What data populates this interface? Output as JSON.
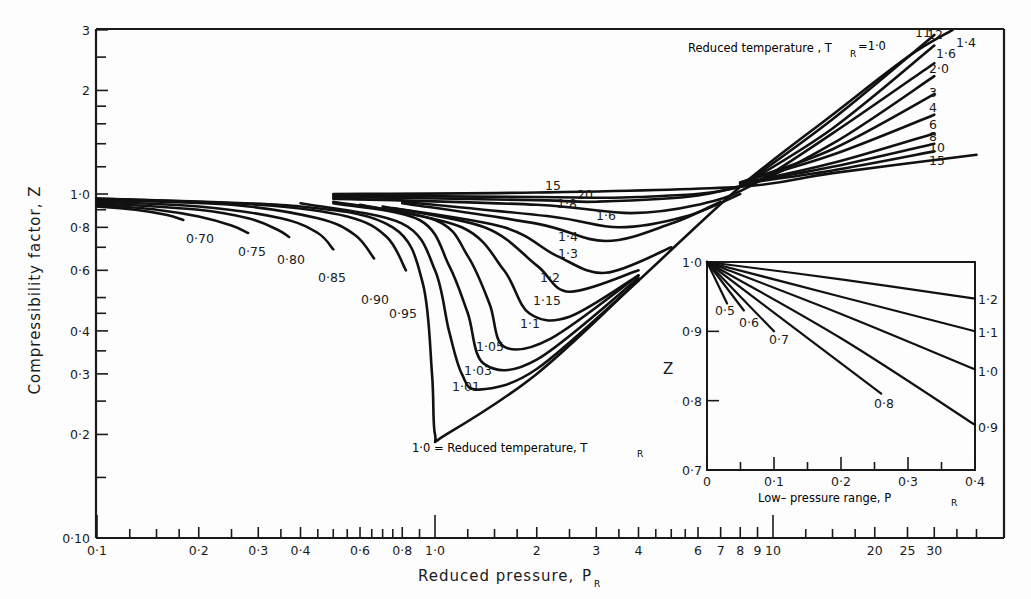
{
  "chart_data": {
    "type": "line",
    "xlabel": "Reduced pressure, P_R",
    "ylabel": "Compressibility factor, Z",
    "x_scale": "log",
    "y_scale": "log",
    "xlim": [
      0.1,
      45
    ],
    "ylim": [
      0.1,
      3
    ],
    "grid": false,
    "x_ticks_labeled": [
      "0·1",
      "0·2",
      "0·3",
      "0·4",
      "0·6",
      "0·8",
      "1·0",
      "2",
      "3",
      "4",
      "6",
      "7",
      "8",
      "9",
      "10",
      "20",
      "25",
      "30"
    ],
    "x_tick_values": [
      0.1,
      0.2,
      0.3,
      0.4,
      0.6,
      0.8,
      1.0,
      2,
      3,
      4,
      6,
      7,
      8,
      9,
      10,
      20,
      25,
      30
    ],
    "y_ticks_labeled": [
      "3",
      "2",
      "1·0",
      "0·8",
      "0·6",
      "0·4",
      "0·3",
      "0·2",
      "0·10"
    ],
    "y_tick_values": [
      3,
      2,
      1.0,
      0.8,
      0.6,
      0.4,
      0.3,
      0.2,
      0.1
    ],
    "annotations": [
      "Reduced temperature, T_R = 1·0",
      "1·0 = Reduced temperature, T_R"
    ],
    "series": [
      {
        "name": "T_R=0.70",
        "points": [
          [
            0.1,
            0.92
          ],
          [
            0.13,
            0.9
          ],
          [
            0.16,
            0.87
          ],
          [
            0.18,
            0.84
          ]
        ]
      },
      {
        "name": "T_R=0.75",
        "points": [
          [
            0.1,
            0.93
          ],
          [
            0.15,
            0.9
          ],
          [
            0.2,
            0.86
          ],
          [
            0.25,
            0.81
          ],
          [
            0.28,
            0.77
          ]
        ]
      },
      {
        "name": "T_R=0.80",
        "points": [
          [
            0.1,
            0.94
          ],
          [
            0.2,
            0.9
          ],
          [
            0.28,
            0.85
          ],
          [
            0.34,
            0.79
          ],
          [
            0.37,
            0.75
          ]
        ]
      },
      {
        "name": "T_R=0.85",
        "points": [
          [
            0.1,
            0.95
          ],
          [
            0.2,
            0.92
          ],
          [
            0.35,
            0.85
          ],
          [
            0.45,
            0.77
          ],
          [
            0.5,
            0.69
          ]
        ]
      },
      {
        "name": "T_R=0.90",
        "points": [
          [
            0.1,
            0.96
          ],
          [
            0.25,
            0.93
          ],
          [
            0.45,
            0.85
          ],
          [
            0.58,
            0.76
          ],
          [
            0.66,
            0.65
          ]
        ]
      },
      {
        "name": "T_R=0.95",
        "points": [
          [
            0.1,
            0.97
          ],
          [
            0.3,
            0.93
          ],
          [
            0.55,
            0.86
          ],
          [
            0.72,
            0.75
          ],
          [
            0.82,
            0.6
          ]
        ]
      },
      {
        "name": "T_R=1.0",
        "points": [
          [
            0.1,
            0.97
          ],
          [
            0.4,
            0.92
          ],
          [
            0.75,
            0.8
          ],
          [
            0.92,
            0.55
          ],
          [
            0.98,
            0.3
          ],
          [
            1.0,
            0.2
          ],
          [
            1.08,
            0.2
          ],
          [
            2,
            0.3
          ],
          [
            4,
            0.56
          ],
          [
            8,
            1.05
          ],
          [
            15,
            1.7
          ],
          [
            25,
            2.5
          ],
          [
            34,
            3.0
          ]
        ]
      },
      {
        "name": "T_R=1.01",
        "points": [
          [
            0.4,
            0.94
          ],
          [
            0.8,
            0.82
          ],
          [
            1.0,
            0.6
          ],
          [
            1.1,
            0.4
          ],
          [
            1.2,
            0.3
          ],
          [
            1.35,
            0.27
          ],
          [
            2,
            0.31
          ],
          [
            4,
            0.56
          ]
        ]
      },
      {
        "name": "T_R=1.03",
        "points": [
          [
            0.5,
            0.94
          ],
          [
            0.9,
            0.84
          ],
          [
            1.1,
            0.62
          ],
          [
            1.25,
            0.45
          ],
          [
            1.4,
            0.32
          ],
          [
            2,
            0.33
          ],
          [
            4,
            0.57
          ]
        ]
      },
      {
        "name": "T_R=1.05",
        "points": [
          [
            0.5,
            0.95
          ],
          [
            1.0,
            0.84
          ],
          [
            1.25,
            0.66
          ],
          [
            1.45,
            0.48
          ],
          [
            1.6,
            0.36
          ],
          [
            2.2,
            0.38
          ],
          [
            4,
            0.58
          ]
        ]
      },
      {
        "name": "T_R=1.1",
        "points": [
          [
            0.6,
            0.93
          ],
          [
            1.2,
            0.8
          ],
          [
            1.6,
            0.6
          ],
          [
            1.9,
            0.45
          ],
          [
            2.5,
            0.44
          ],
          [
            4,
            0.58
          ]
        ]
      },
      {
        "name": "T_R=1.15",
        "points": [
          [
            0.7,
            0.92
          ],
          [
            1.4,
            0.8
          ],
          [
            2,
            0.62
          ],
          [
            2.5,
            0.52
          ],
          [
            4,
            0.6
          ]
        ]
      },
      {
        "name": "T_R=1.2",
        "points": [
          [
            0.75,
            0.91
          ],
          [
            1.6,
            0.8
          ],
          [
            2.3,
            0.66
          ],
          [
            3.2,
            0.59
          ],
          [
            5,
            0.7
          ]
        ]
      },
      {
        "name": "T_R=1.3",
        "points": [
          [
            0.8,
            0.94
          ],
          [
            2,
            0.82
          ],
          [
            3.2,
            0.73
          ],
          [
            5,
            0.82
          ],
          [
            7,
            0.95
          ]
        ]
      },
      {
        "name": "T_R=1.4",
        "points": [
          [
            0.8,
            0.95
          ],
          [
            2.2,
            0.86
          ],
          [
            3.5,
            0.8
          ],
          [
            5.5,
            0.86
          ],
          [
            8,
            1.0
          ]
        ]
      },
      {
        "name": "T_R=1.6",
        "points": [
          [
            0.5,
            0.97
          ],
          [
            2,
            0.93
          ],
          [
            3.8,
            0.88
          ],
          [
            6,
            0.93
          ],
          [
            8.5,
            1.05
          ],
          [
            15,
            1.5
          ],
          [
            30,
            2.4
          ]
        ]
      },
      {
        "name": "T_R=1.8",
        "points": [
          [
            0.5,
            0.98
          ],
          [
            2,
            0.96
          ],
          [
            3,
            0.95
          ],
          [
            6,
            0.99
          ],
          [
            10,
            1.12
          ]
        ]
      },
      {
        "name": "T_R=2.0",
        "points": [
          [
            0.5,
            0.99
          ],
          [
            2,
            0.98
          ],
          [
            4,
            0.98
          ],
          [
            8,
            1.05
          ],
          [
            15,
            1.4
          ],
          [
            30,
            2.2
          ]
        ]
      },
      {
        "name": "T_R=15",
        "points": [
          [
            0.5,
            1.0
          ],
          [
            2,
            1.01
          ],
          [
            8,
            1.05
          ],
          [
            15,
            1.15
          ],
          [
            40,
            1.3
          ]
        ]
      },
      {
        "name": "T_R=3",
        "points": [
          [
            8,
            1.08
          ],
          [
            15,
            1.35
          ],
          [
            30,
            1.95
          ]
        ]
      },
      {
        "name": "T_R=4",
        "points": [
          [
            8,
            1.08
          ],
          [
            15,
            1.3
          ],
          [
            30,
            1.7
          ]
        ]
      },
      {
        "name": "T_R=6",
        "points": [
          [
            8,
            1.07
          ],
          [
            15,
            1.23
          ],
          [
            30,
            1.5
          ]
        ]
      },
      {
        "name": "T_R=8",
        "points": [
          [
            8,
            1.07
          ],
          [
            15,
            1.2
          ],
          [
            30,
            1.4
          ]
        ]
      },
      {
        "name": "T_R=10",
        "points": [
          [
            8,
            1.07
          ],
          [
            15,
            1.17
          ],
          [
            30,
            1.33
          ]
        ]
      },
      {
        "name": "T_R=11",
        "points": [
          [
            8,
            1.05
          ],
          [
            15,
            1.65
          ],
          [
            30,
            2.9
          ]
        ]
      },
      {
        "name": "T_R=12",
        "points": [
          [
            8,
            1.05
          ],
          [
            15,
            1.55
          ],
          [
            30,
            2.7
          ]
        ]
      }
    ],
    "inset": {
      "title": "Low-pressure range",
      "xlabel": "Low- pressure range, P_R",
      "ylabel": "Z",
      "xlim": [
        0,
        0.4
      ],
      "ylim": [
        0.7,
        1.0
      ],
      "x_ticks": [
        "0",
        "0·1",
        "0·2",
        "0·3",
        "0·4"
      ],
      "y_ticks": [
        "1·0",
        "0·9",
        "0·8",
        "0·7"
      ],
      "series": [
        {
          "name": "T_R=0.5",
          "points": [
            [
              0,
              1.0
            ],
            [
              0.03,
              0.94
            ]
          ]
        },
        {
          "name": "T_R=0.6",
          "points": [
            [
              0,
              1.0
            ],
            [
              0.055,
              0.93
            ]
          ]
        },
        {
          "name": "T_R=0.7",
          "points": [
            [
              0,
              1.0
            ],
            [
              0.1,
              0.9
            ]
          ]
        },
        {
          "name": "T_R=0.8",
          "points": [
            [
              0,
              1.0
            ],
            [
              0.26,
              0.81
            ]
          ]
        },
        {
          "name": "T_R=0.9",
          "points": [
            [
              0,
              1.0
            ],
            [
              0.2,
              0.89
            ],
            [
              0.4,
              0.765
            ]
          ]
        },
        {
          "name": "T_R=1.0",
          "points": [
            [
              0,
              1.0
            ],
            [
              0.2,
              0.925
            ],
            [
              0.4,
              0.845
            ]
          ]
        },
        {
          "name": "T_R=1.1",
          "points": [
            [
              0,
              1.0
            ],
            [
              0.2,
              0.95
            ],
            [
              0.4,
              0.9
            ]
          ]
        },
        {
          "name": "T_R=1.2",
          "points": [
            [
              0,
              1.0
            ],
            [
              0.2,
              0.975
            ],
            [
              0.4,
              0.947
            ]
          ]
        }
      ]
    }
  },
  "labels": {
    "y_axis": "Compressibility factor, Z",
    "x_axis_main": "Reduced pressure,",
    "x_axis_sym": "P",
    "x_axis_sub": "R",
    "top_annot": "Reduced temperature , T",
    "top_annot_sub": "R",
    "top_annot_val": "=1·0",
    "bottom_annot": "1·0 = Reduced temperature,  T",
    "bottom_annot_sub": "R",
    "inset_xlabel": "Low– pressure range,  P",
    "inset_xlabel_sub": "R",
    "inset_ylabel": "Z",
    "curve_labels": {
      "t070": "0·70",
      "t075": "0·75",
      "t080": "0·80",
      "t085": "0·85",
      "t090": "0·90",
      "t095": "0·95",
      "t101": "1·01",
      "t103": "1·03",
      "t105": "1·05",
      "t11": "1·1",
      "t115": "1·15",
      "t12": "1·2",
      "t13": "1·3",
      "t14": "1·4",
      "t16": "1·6",
      "t18": "1·8",
      "t20": "20",
      "t15": "15",
      "r11": "11",
      "r12": "12",
      "r14": "1·4",
      "r16": "1·6",
      "r20": "2·0",
      "r3": "3",
      "r4": "4",
      "r6": "6",
      "r8": "8",
      "r10": "10",
      "r15": "15",
      "i05": "0·5",
      "i06": "0·6",
      "i07": "0·7",
      "i08": "0·8",
      "i12": "1·2",
      "i11": "1·1",
      "i10": "1·0",
      "i09": "0·9"
    }
  }
}
